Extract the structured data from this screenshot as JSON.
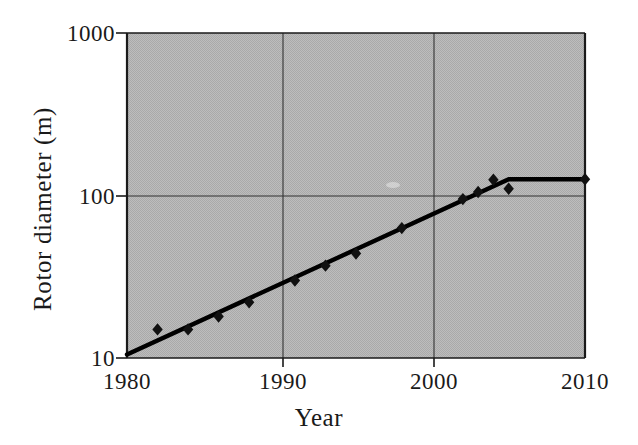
{
  "chart_data": {
    "type": "scatter",
    "title": "",
    "xlabel": "Year",
    "ylabel": "Rotor diameter (m)",
    "xlim": [
      1980,
      2010
    ],
    "ylim": [
      10,
      1000
    ],
    "yscale": "log",
    "xscale": "linear",
    "grid": true,
    "legend": "none",
    "background_color": "#b9b9b9",
    "line_color": "#000000",
    "marker_color": "#000000",
    "marker_shape": "diamond",
    "x_ticks": [
      "1980",
      "1990",
      "2000",
      "2010"
    ],
    "x_tick_values": [
      1980,
      1990,
      2000,
      2010
    ],
    "y_ticks": [
      "10",
      "100",
      "1000"
    ],
    "y_tick_values": [
      10,
      100,
      1000
    ],
    "series": [
      {
        "name": "Rotor diameter data points",
        "kind": "scatter",
        "points": [
          {
            "x": 1982,
            "y": 15
          },
          {
            "x": 1984,
            "y": 15
          },
          {
            "x": 1986,
            "y": 18
          },
          {
            "x": 1988,
            "y": 22
          },
          {
            "x": 1991,
            "y": 30
          },
          {
            "x": 1993,
            "y": 37
          },
          {
            "x": 1995,
            "y": 44
          },
          {
            "x": 1998,
            "y": 63
          },
          {
            "x": 2002,
            "y": 95
          },
          {
            "x": 2003,
            "y": 105
          },
          {
            "x": 2004,
            "y": 125
          },
          {
            "x": 2005,
            "y": 110
          },
          {
            "x": 2010,
            "y": 126
          }
        ]
      },
      {
        "name": "Trend line",
        "kind": "line",
        "points": [
          {
            "x": 1980,
            "y": 10.5
          },
          {
            "x": 2005,
            "y": 126
          },
          {
            "x": 2010,
            "y": 126
          }
        ]
      }
    ]
  },
  "axes": {
    "y_title": "Rotor diameter (m)",
    "x_title": "Year",
    "y_tick_labels": {
      "top": "1000",
      "mid": "100",
      "bottom": "10"
    },
    "x_tick_labels": {
      "t1": "1980",
      "t2": "1990",
      "t3": "2000",
      "t4": "2010"
    }
  }
}
